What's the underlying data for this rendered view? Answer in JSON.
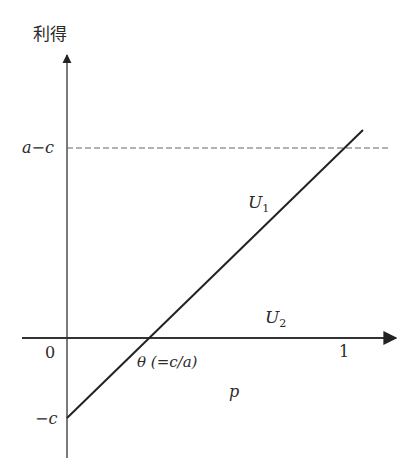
{
  "diagram": {
    "type": "payoff-line-graph",
    "y_axis": {
      "label": "利得"
    },
    "x_axis": {
      "label": "p"
    },
    "y_ticks": {
      "top": "a−c",
      "origin": "0",
      "bottom": "−c"
    },
    "x_ticks": {
      "one": "1",
      "theta": "θ (=c/a)"
    },
    "curves": [
      {
        "name": "U",
        "sub": "1",
        "description": "line from (0, −c) to (1, a−c)"
      },
      {
        "name": "U",
        "sub": "2",
        "description": "horizontal along p-axis (payoff 0)"
      }
    ],
    "reference_line": {
      "style": "dashed",
      "level": "a−c"
    },
    "colors": {
      "line": "#222222",
      "axis": "#333333",
      "dashed": "#666666"
    }
  }
}
